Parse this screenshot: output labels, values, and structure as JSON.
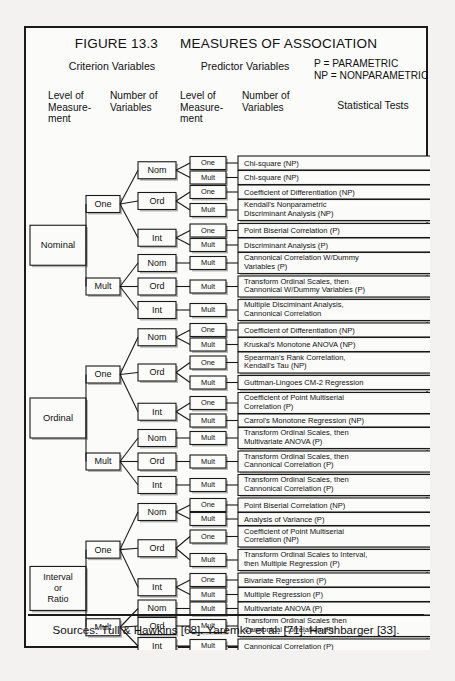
{
  "figure": {
    "number": "FIGURE 13.3",
    "title": "MEASURES OF ASSOCIATION"
  },
  "headers": {
    "criterion_group": "Criterion Variables",
    "predictor_group": "Predictor Variables",
    "legend_parametric": "P = PARAMETRIC",
    "legend_nonparametric": "NP = NONPARAMETRIC",
    "col1": "Level of\nMeasure-\nment",
    "col1_lines": [
      "Level of",
      "Measure-",
      "ment"
    ],
    "col2_lines": [
      "Number of",
      "Variables"
    ],
    "col3_lines": [
      "Level of",
      "Measure-",
      "ment"
    ],
    "col4_lines": [
      "Number of",
      "Variables"
    ],
    "col5": "Statistical  Tests"
  },
  "sources": "Sources:  Tull & Hawkins [68]. Yaremko et al. [71]. Harshbarger [33].",
  "colors": {
    "ink": "#1a1a1a",
    "paper": "#fbfbfa",
    "shadow": "#b9b7b4",
    "page": "#f3f2f0"
  },
  "labels": {
    "nominal": "Nominal",
    "ordinal": "Ordinal",
    "interval_ratio_lines": [
      "Interval",
      "or",
      "Ratio"
    ],
    "one": "One",
    "mult": "Mult",
    "nom": "Nom",
    "ord": "Ord",
    "int": "Int"
  },
  "chart_data": {
    "type": "tree",
    "title": "MEASURES OF ASSOCIATION",
    "levels": [
      "Criterion Level of Measurement",
      "Criterion Number of Variables",
      "Predictor Level of Measurement",
      "Predictor Number of Variables",
      "Statistical Tests"
    ],
    "rows": [
      {
        "criterion_level": "Nominal",
        "criterion_n": "One",
        "predictor_level": "Nom",
        "predictor_n": "One",
        "test": "Chi-square (NP)"
      },
      {
        "criterion_level": "Nominal",
        "criterion_n": "One",
        "predictor_level": "Nom",
        "predictor_n": "Mult",
        "test": "Chi-square (NP)"
      },
      {
        "criterion_level": "Nominal",
        "criterion_n": "One",
        "predictor_level": "Ord",
        "predictor_n": "One",
        "test": "Coefficient of Differentiation (NP)"
      },
      {
        "criterion_level": "Nominal",
        "criterion_n": "One",
        "predictor_level": "Ord",
        "predictor_n": "Mult",
        "test": "Kendall's Nonparametric\nDiscriminant Analysis (NP)"
      },
      {
        "criterion_level": "Nominal",
        "criterion_n": "One",
        "predictor_level": "Int",
        "predictor_n": "One",
        "test": "Point Biserial Correlation (P)"
      },
      {
        "criterion_level": "Nominal",
        "criterion_n": "One",
        "predictor_level": "Int",
        "predictor_n": "Mult",
        "test": "Discriminant Analysis (P)"
      },
      {
        "criterion_level": "Nominal",
        "criterion_n": "Mult",
        "predictor_level": "Nom",
        "predictor_n": "Mult",
        "test": "Cannonical Correlation W/Dummy\nVariables (P)"
      },
      {
        "criterion_level": "Nominal",
        "criterion_n": "Mult",
        "predictor_level": "Ord",
        "predictor_n": "Mult",
        "test": "Transform Ordinal Scales, then\nCannonical W/Dummy Variables  (P)"
      },
      {
        "criterion_level": "Nominal",
        "criterion_n": "Mult",
        "predictor_level": "Int",
        "predictor_n": "Mult",
        "test": "Multiple Disciminant Analysis,\nCannonical Correlation"
      },
      {
        "criterion_level": "Ordinal",
        "criterion_n": "One",
        "predictor_level": "Nom",
        "predictor_n": "One",
        "test": "Coefficient of Differentiation (NP)"
      },
      {
        "criterion_level": "Ordinal",
        "criterion_n": "One",
        "predictor_level": "Nom",
        "predictor_n": "Mult",
        "test": "Kruskal's Monotone ANOVA (NP)"
      },
      {
        "criterion_level": "Ordinal",
        "criterion_n": "One",
        "predictor_level": "Ord",
        "predictor_n": "One",
        "test": "Spearman's Rank Correlation,\nKendall's Tau (NP)"
      },
      {
        "criterion_level": "Ordinal",
        "criterion_n": "One",
        "predictor_level": "Ord",
        "predictor_n": "Mult",
        "test": "Guttman-Lingoes CM-2 Regression"
      },
      {
        "criterion_level": "Ordinal",
        "criterion_n": "One",
        "predictor_level": "Int",
        "predictor_n": "One",
        "test": "Coefficient of Point Multiserial\nCorrelation (P)"
      },
      {
        "criterion_level": "Ordinal",
        "criterion_n": "One",
        "predictor_level": "Int",
        "predictor_n": "Mult",
        "test": "Carrol's Monotone Regression (NP)"
      },
      {
        "criterion_level": "Ordinal",
        "criterion_n": "Mult",
        "predictor_level": "Nom",
        "predictor_n": "Mult",
        "test": "Transform Ordinal Scales, then\nMultivariate ANOVA (P)"
      },
      {
        "criterion_level": "Ordinal",
        "criterion_n": "Mult",
        "predictor_level": "Ord",
        "predictor_n": "Mult",
        "test": "Transform Ordinal Scales, then\nCannonical Correlation (P)"
      },
      {
        "criterion_level": "Ordinal",
        "criterion_n": "Mult",
        "predictor_level": "Int",
        "predictor_n": "Mult",
        "test": "Transform Ordinal Scales, then\nCannonical Correlation (P)"
      },
      {
        "criterion_level": "Interval or Ratio",
        "criterion_n": "One",
        "predictor_level": "Nom",
        "predictor_n": "One",
        "test": "Point Biserial Correlation (NP)"
      },
      {
        "criterion_level": "Interval or Ratio",
        "criterion_n": "One",
        "predictor_level": "Nom",
        "predictor_n": "Mult",
        "test": "Analysis of Variance (P)"
      },
      {
        "criterion_level": "Interval or Ratio",
        "criterion_n": "One",
        "predictor_level": "Ord",
        "predictor_n": "One",
        "test": "Coefficient of Point Multiserial\nCorrelation (NP)"
      },
      {
        "criterion_level": "Interval or Ratio",
        "criterion_n": "One",
        "predictor_level": "Ord",
        "predictor_n": "Mult",
        "test": "Transform Ordinal Scales to Interval,\nthen Multiple Regression (P)"
      },
      {
        "criterion_level": "Interval or Ratio",
        "criterion_n": "One",
        "predictor_level": "Int",
        "predictor_n": "One",
        "test": "Bivariate Regression (P)"
      },
      {
        "criterion_level": "Interval or Ratio",
        "criterion_n": "One",
        "predictor_level": "Int",
        "predictor_n": "Mult",
        "test": "Multiple Regression (P)"
      },
      {
        "criterion_level": "Interval or Ratio",
        "criterion_n": "Mult",
        "predictor_level": "Nom",
        "predictor_n": "Mult",
        "test": "Multivariate ANOVA (P)"
      },
      {
        "criterion_level": "Interval or Ratio",
        "criterion_n": "Mult",
        "predictor_level": "Ord",
        "predictor_n": "Mult",
        "test": "Transform Ordinal Scales then\nCannonical Correlation (P)"
      },
      {
        "criterion_level": "Interval or Ratio",
        "criterion_n": "Mult",
        "predictor_level": "Int",
        "predictor_n": "Mult",
        "test": "Cannonical Correlation (P)"
      }
    ]
  },
  "geometry": {
    "test_rows": [
      {
        "y": 128,
        "h": 14,
        "lines": 1,
        "pn": "One"
      },
      {
        "y": 142.5,
        "h": 14,
        "lines": 1,
        "pn": "Mult"
      },
      {
        "y": 157,
        "h": 14,
        "lines": 1,
        "pn": "One"
      },
      {
        "y": 171.5,
        "h": 21,
        "lines": 2,
        "pn": "Mult"
      },
      {
        "y": 195.5,
        "h": 14,
        "lines": 1,
        "pn": "One"
      },
      {
        "y": 210,
        "h": 14,
        "lines": 1,
        "pn": "Mult"
      },
      {
        "y": 224.5,
        "h": 21,
        "lines": 2,
        "pn": "Mult"
      },
      {
        "y": 248,
        "h": 21,
        "lines": 2,
        "pn": "Mult"
      },
      {
        "y": 271.5,
        "h": 21,
        "lines": 2,
        "pn": "Mult"
      },
      {
        "y": 295,
        "h": 14,
        "lines": 1,
        "pn": "One"
      },
      {
        "y": 309.5,
        "h": 14,
        "lines": 1,
        "pn": "Mult"
      },
      {
        "y": 324,
        "h": 21,
        "lines": 2,
        "pn": "One"
      },
      {
        "y": 347.5,
        "h": 14,
        "lines": 1,
        "pn": "Mult"
      },
      {
        "y": 364.5,
        "h": 21,
        "lines": 2,
        "pn": "One"
      },
      {
        "y": 386,
        "h": 13,
        "lines": 1,
        "pn": "Mult"
      },
      {
        "y": 399.5,
        "h": 21,
        "lines": 2,
        "pn": "Mult"
      },
      {
        "y": 423,
        "h": 21,
        "lines": 2,
        "pn": "Mult"
      },
      {
        "y": 446.5,
        "h": 21,
        "lines": 2,
        "pn": "Mult"
      },
      {
        "y": 470,
        "h": 14,
        "lines": 1,
        "pn": "One"
      },
      {
        "y": 484.5,
        "h": 13,
        "lines": 1,
        "pn": "Mult"
      },
      {
        "y": 498,
        "h": 21,
        "lines": 2,
        "pn": "One"
      },
      {
        "y": 521.5,
        "h": 21,
        "lines": 2,
        "pn": "Mult"
      },
      {
        "y": 545,
        "h": 14,
        "lines": 1,
        "pn": "One"
      },
      {
        "y": 559.5,
        "h": 14,
        "lines": 1,
        "pn": "Mult"
      },
      {
        "y": 574,
        "h": 13,
        "lines": 1,
        "pn": "Mult"
      },
      {
        "y": 587.5,
        "h": 21,
        "lines": 2,
        "pn": "Mult"
      },
      {
        "y": 611,
        "h": 14,
        "lines": 1,
        "pn": "Mult"
      }
    ],
    "pred_level_boxes": [
      {
        "label": "Nom",
        "rows": [
          0,
          1
        ]
      },
      {
        "label": "Ord",
        "rows": [
          2,
          3
        ]
      },
      {
        "label": "Int",
        "rows": [
          4,
          5
        ]
      },
      {
        "label": "Nom",
        "rows": [
          6
        ]
      },
      {
        "label": "Ord",
        "rows": [
          7
        ]
      },
      {
        "label": "Int",
        "rows": [
          8
        ]
      },
      {
        "label": "Nom",
        "rows": [
          9,
          10
        ]
      },
      {
        "label": "Ord",
        "rows": [
          11,
          12
        ]
      },
      {
        "label": "Int",
        "rows": [
          13,
          14
        ]
      },
      {
        "label": "Nom",
        "rows": [
          15
        ]
      },
      {
        "label": "Ord",
        "rows": [
          16
        ]
      },
      {
        "label": "Int",
        "rows": [
          17
        ]
      },
      {
        "label": "Nom",
        "rows": [
          18,
          19
        ]
      },
      {
        "label": "Ord",
        "rows": [
          20,
          21
        ]
      },
      {
        "label": "Int",
        "rows": [
          22,
          23
        ]
      },
      {
        "label": "Nom",
        "rows": [
          24
        ]
      },
      {
        "label": "Ord",
        "rows": [
          25
        ]
      },
      {
        "label": "Int",
        "rows": [
          26
        ]
      }
    ],
    "crit_n_boxes": [
      {
        "label": "One",
        "pl": [
          0,
          1,
          2
        ]
      },
      {
        "label": "Mult",
        "pl": [
          3,
          4,
          5
        ]
      },
      {
        "label": "One",
        "pl": [
          6,
          7,
          8
        ]
      },
      {
        "label": "Mult",
        "pl": [
          9,
          10,
          11
        ]
      },
      {
        "label": "One",
        "pl": [
          12,
          13,
          14
        ]
      },
      {
        "label": "Mult",
        "pl": [
          15,
          16,
          17
        ]
      }
    ],
    "crit_level_boxes": [
      {
        "label": "Nominal",
        "cn": [
          0,
          1
        ]
      },
      {
        "label": "Ordinal",
        "cn": [
          2,
          3
        ]
      },
      {
        "label": "Interval or Ratio",
        "cn": [
          4,
          5
        ]
      }
    ]
  }
}
